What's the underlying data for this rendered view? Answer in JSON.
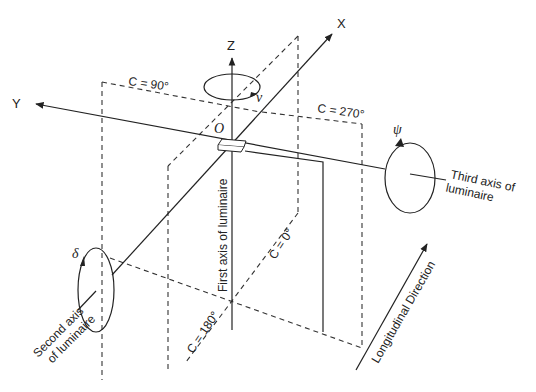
{
  "diagram": {
    "axes": {
      "x": "X",
      "y": "Y",
      "z": "Z",
      "origin": "O"
    },
    "rotations": {
      "nu": "ν",
      "psi": "ψ",
      "delta": "δ"
    },
    "planes": {
      "c90": "C = 90°",
      "c270": "C = 270°",
      "c0": "C = 0°",
      "c180": "C = 180°"
    },
    "labels": {
      "first_axis": "First axis of luminaire",
      "second_axis_line1": "Second axis",
      "second_axis_line2": "of luminaire",
      "third_axis_line1": "Third axis of",
      "third_axis_line2": "luminaire",
      "longitudinal": "Longitudinal Direction"
    },
    "colors": {
      "line": "#222222",
      "background": "#ffffff"
    }
  }
}
